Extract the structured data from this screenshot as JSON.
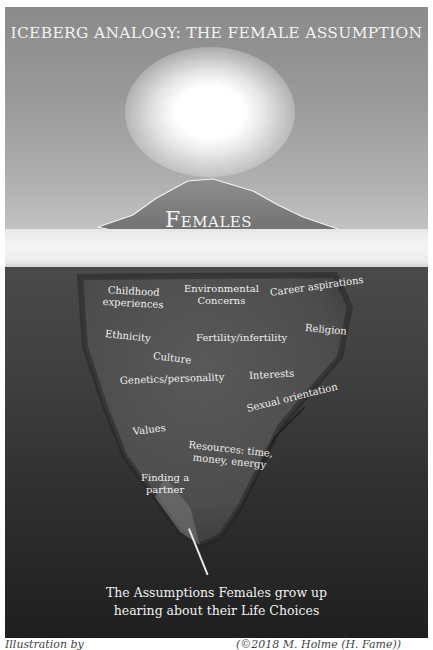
{
  "title": "ICEBERG ANALOGY: THE FEMALE ASSUMPTION",
  "tip_label": "Females",
  "submerged_labels": [
    {
      "text": "Childhood\nexperiences",
      "x": 103,
      "y": 284,
      "rot": 3
    },
    {
      "text": "Environmental\nConcerns",
      "x": 184,
      "y": 283,
      "rot": 0
    },
    {
      "text": "Career aspirations",
      "x": 270,
      "y": 287,
      "rot": -8
    },
    {
      "text": "Ethnicity",
      "x": 105,
      "y": 328,
      "rot": 6
    },
    {
      "text": "Fertility/infertility",
      "x": 196,
      "y": 332,
      "rot": 0
    },
    {
      "text": "Religion",
      "x": 305,
      "y": 322,
      "rot": 5
    },
    {
      "text": "Culture",
      "x": 153,
      "y": 350,
      "rot": 7
    },
    {
      "text": "Interests",
      "x": 249,
      "y": 370,
      "rot": -3
    },
    {
      "text": "Genetics/personality",
      "x": 120,
      "y": 375,
      "rot": -2
    },
    {
      "text": "Sexual orientation",
      "x": 247,
      "y": 403,
      "rot": -14
    },
    {
      "text": "Values",
      "x": 133,
      "y": 426,
      "rot": -7
    },
    {
      "text": "Resources: time,\nmoney, energy",
      "x": 188,
      "y": 439,
      "rot": 6
    },
    {
      "text": "Finding a\npartner",
      "x": 141,
      "y": 472,
      "rot": 0
    }
  ],
  "footer": {
    "line1": "The Assumptions Females grow up",
    "line2": "hearing about their Life Choices"
  },
  "caption": {
    "left": "Illustration by",
    "right": "(©2018 M. Holme (H. Fame))"
  }
}
